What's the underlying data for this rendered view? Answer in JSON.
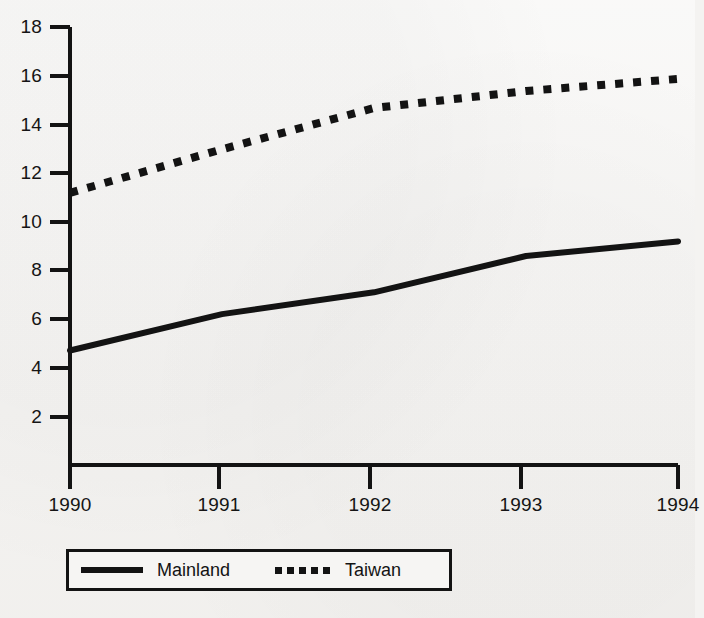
{
  "chart_data": {
    "type": "line",
    "title": "",
    "subtitle": "",
    "xlabel": "",
    "ylabel": "",
    "x": [
      1990,
      1991,
      1992,
      1993,
      1994
    ],
    "xticklabels": [
      "1990",
      "1991",
      "1992",
      "1993",
      "1994"
    ],
    "yticklabels": [
      "2",
      "4",
      "6",
      "8",
      "10",
      "12",
      "14",
      "16",
      "18"
    ],
    "yticks": [
      2,
      4,
      6,
      8,
      10,
      12,
      14,
      16,
      18
    ],
    "xlim": [
      1990,
      1994
    ],
    "ylim": [
      0,
      18
    ],
    "grid": false,
    "legend_position": "bottom",
    "series": [
      {
        "name": "Mainland",
        "style": "solid",
        "color": "#131313",
        "values": [
          4.7,
          6.2,
          7.1,
          8.6,
          9.2
        ]
      },
      {
        "name": "Taiwan",
        "style": "dotted",
        "color": "#131313",
        "values": [
          11.2,
          13.0,
          14.7,
          15.4,
          15.9
        ]
      }
    ],
    "legend": [
      "Mainland",
      "Taiwan"
    ],
    "annotations": []
  },
  "axes": {
    "y_tick_labels": [
      "18",
      "16",
      "14",
      "12",
      "10",
      "8",
      "6",
      "4",
      "2"
    ],
    "x_tick_labels": [
      "1990",
      "1991",
      "1992",
      "1993",
      "1994"
    ]
  },
  "legend": {
    "entries": [
      {
        "label": "Mainland",
        "swatch": "solid-line-swatch"
      },
      {
        "label": "Taiwan",
        "swatch": "dotted-line-swatch"
      }
    ]
  },
  "colors": {
    "ink": "#131313",
    "paper": "#f4f3f1"
  }
}
